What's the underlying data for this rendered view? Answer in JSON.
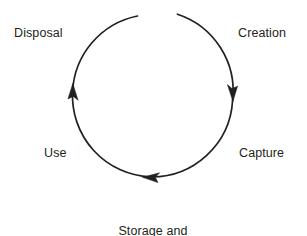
{
  "diagram": {
    "type": "cycle",
    "title": "",
    "background_color": "#ffffff",
    "stroke_color": "#231f20",
    "text_color": "#231f20",
    "geometry": {
      "center_x": 153,
      "center_y": 96,
      "radius": 81,
      "gap_at_top": true
    },
    "nodes": [
      {
        "id": "creation",
        "label": "Creation",
        "position": "top-right"
      },
      {
        "id": "capture",
        "label": "Capture",
        "position": "right"
      },
      {
        "id": "storage",
        "label": "Storage and\nmaintenance",
        "line1": "Storage and",
        "line2": "maintenance",
        "position": "bottom"
      },
      {
        "id": "use",
        "label": "Use",
        "position": "left"
      },
      {
        "id": "disposal",
        "label": "Disposal",
        "position": "top-left"
      }
    ],
    "arrows": [
      {
        "id": "creation-to-capture",
        "points_to": "capture",
        "direction": "down",
        "tip_x": 232,
        "tip_y": 100
      },
      {
        "id": "capture-to-storage",
        "points_to": "storage",
        "direction": "left",
        "tip_x": 143,
        "tip_y": 177
      },
      {
        "id": "use-to-disposal",
        "points_to": "disposal",
        "direction": "up",
        "tip_x": 73,
        "tip_y": 84
      }
    ]
  }
}
